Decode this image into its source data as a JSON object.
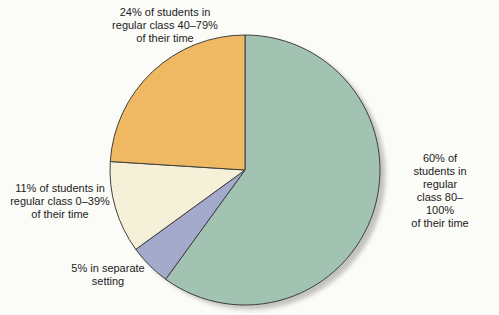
{
  "chart_data": {
    "type": "pie",
    "start_angle_deg": 0,
    "direction": "clockwise",
    "outline_color": "#3f3f3f",
    "shadow_color": "#c2c2c0",
    "slices": [
      {
        "name": "regular-class-80-100",
        "value": 60,
        "color": "#a2c3b2",
        "label": "60% of students in\nregular class 80–100%\nof their time"
      },
      {
        "name": "separate-setting",
        "value": 5,
        "color": "#a3aacb",
        "label": "5% in separate\nsetting"
      },
      {
        "name": "regular-class-0-39",
        "value": 11,
        "color": "#f5f1d9",
        "label": "11% of students in\nregular class 0–39%\nof their time"
      },
      {
        "name": "regular-class-40-79",
        "value": 24,
        "color": "#eeb962",
        "label": "24% of students in\nregular class 40–79%\nof their time"
      }
    ]
  }
}
